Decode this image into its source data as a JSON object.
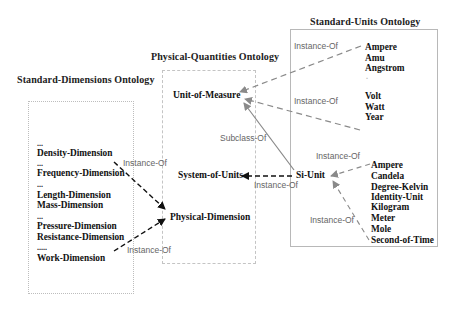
{
  "ontologies": {
    "standard_units": {
      "title": "Standard-Units Ontology",
      "group_1": [
        "Ampere",
        "Amu",
        "Angstrom",
        "Volt",
        "Watt",
        "Year"
      ],
      "group_1_ellipsis": ".",
      "group_2": [
        "Ampere",
        "Candela",
        "Degree-Kelvin",
        "Identity-Unit",
        "Kilogram",
        "Meter",
        "Mole",
        "Second-of-Time"
      ]
    },
    "physical_quantities": {
      "title": "Physical-Quantities Ontology",
      "nodes": {
        "unit_of_measure": "Unit-of-Measure",
        "system_of_units": "System-of-Units",
        "physical_dimension": "Physical-Dimension"
      }
    },
    "standard_dimensions": {
      "title": "Standard-Dimensions Ontology",
      "items": [
        {
          "prefix": "...",
          "name": "Density-Dimension"
        },
        {
          "prefix": "...",
          "name": "Frequency-Dimension"
        },
        {
          "prefix": "...",
          "name": "Length-Dimension"
        },
        {
          "prefix": "",
          "name": "Mass-Dimension"
        },
        {
          "prefix": "...",
          "name": "Pressure-Dimension"
        },
        {
          "prefix": "",
          "name": "Resistance-Dimension"
        },
        {
          "prefix": ".....",
          "name": "Work-Dimension"
        }
      ]
    }
  },
  "si_unit": "Si-Unit",
  "relations": {
    "instance_of": "Instance-Of",
    "subclass_of": "Subclass-Of"
  },
  "edges": [
    {
      "from": "Standard-Units group 1 (top)",
      "to": "Unit-of-Measure",
      "label": "Instance-Of",
      "style": "dashed-gray"
    },
    {
      "from": "Standard-Units group 1 (bottom)",
      "to": "Unit-of-Measure",
      "label": "Instance-Of",
      "style": "dashed-gray"
    },
    {
      "from": "Si-Unit",
      "to": "Unit-of-Measure",
      "label": "Subclass-Of",
      "style": "solid-gray"
    },
    {
      "from": "Si-Unit",
      "to": "System-of-Units",
      "label": "Instance-Of",
      "style": "dashed-black"
    },
    {
      "from": "Ampere (SI)",
      "to": "Si-Unit",
      "label": "Instance-Of",
      "style": "dashed-gray"
    },
    {
      "from": "Second-of-Time",
      "to": "Si-Unit",
      "label": "Instance-Of",
      "style": "dashed-gray"
    },
    {
      "from": "Density-Dimension",
      "to": "Physical-Dimension",
      "label": "Instance-Of",
      "style": "dashed-black"
    },
    {
      "from": "Work-Dimension",
      "to": "Physical-Dimension",
      "label": "Instance-Of",
      "style": "dashed-black"
    }
  ],
  "colors": {
    "background": "#ffffff",
    "text": "#111111",
    "relation_label": "#666666",
    "gray_edge": "#8a8a8a",
    "black_edge": "#111111",
    "box_border": "#bbbbbb"
  }
}
